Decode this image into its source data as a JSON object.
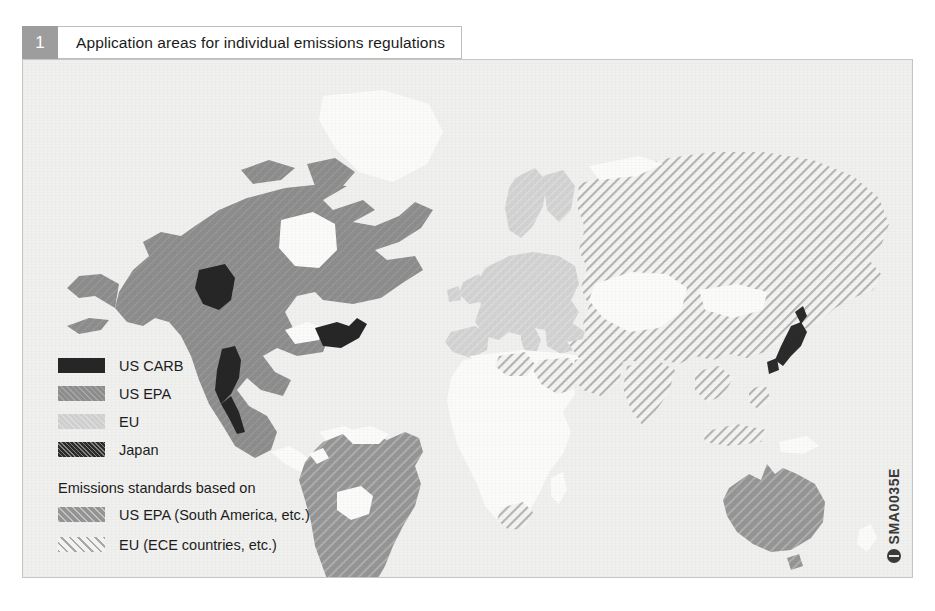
{
  "caption": {
    "number": "1",
    "title": "Application areas for individual emissions regulations"
  },
  "legend": {
    "primary": [
      {
        "label": "US CARB",
        "swatch": "solid-black",
        "color": "#262626"
      },
      {
        "label": "US EPA",
        "swatch": "medium-gray-hatch",
        "color": "#8d8d8d"
      },
      {
        "label": "EU",
        "swatch": "light-gray",
        "color": "#cfcfcf"
      },
      {
        "label": "Japan",
        "swatch": "dark-textured",
        "color": "#2b2b2b"
      }
    ],
    "sub_heading": "Emissions standards based on",
    "based_on": [
      {
        "label": "US EPA (South America, etc.)",
        "swatch": "gray-diagonal",
        "color": "#949494"
      },
      {
        "label": "EU (ECE countries, etc.)",
        "swatch": "white-diagonal-lines",
        "color": "#a8a8a8"
      }
    ]
  },
  "watermark": {
    "code": "SMA0035E",
    "logo": "bosch-circle-logo"
  },
  "map_regions": [
    {
      "name": "North America (USA, Canada, Mexico)",
      "classification": "US EPA"
    },
    {
      "name": "California",
      "classification": "US CARB"
    },
    {
      "name": "Northeast US states",
      "classification": "US CARB"
    },
    {
      "name": "British Columbia / Washington",
      "classification": "US CARB"
    },
    {
      "name": "South America",
      "classification": "US EPA (South America, etc.)"
    },
    {
      "name": "Europe",
      "classification": "EU"
    },
    {
      "name": "Russia and Central Asia",
      "classification": "EU (ECE countries, etc.)"
    },
    {
      "name": "China and East Asia",
      "classification": "EU (ECE countries, etc.)"
    },
    {
      "name": "Japan",
      "classification": "Japan"
    },
    {
      "name": "Australia",
      "classification": "US EPA (South America, etc.)"
    },
    {
      "name": "North Africa and South Africa",
      "classification": "EU (ECE countries, etc.)"
    },
    {
      "name": "Central Africa",
      "classification": "unregulated"
    }
  ],
  "colors": {
    "frame_background": "#f0f0ee",
    "frame_border": "#c6c6c6",
    "caption_badge": "#9d9d9d",
    "carb_black": "#262626",
    "epa_gray": "#8d8d8d",
    "eu_light_gray": "#cfcfcf",
    "hatch_gray": "#a8a8a8"
  }
}
